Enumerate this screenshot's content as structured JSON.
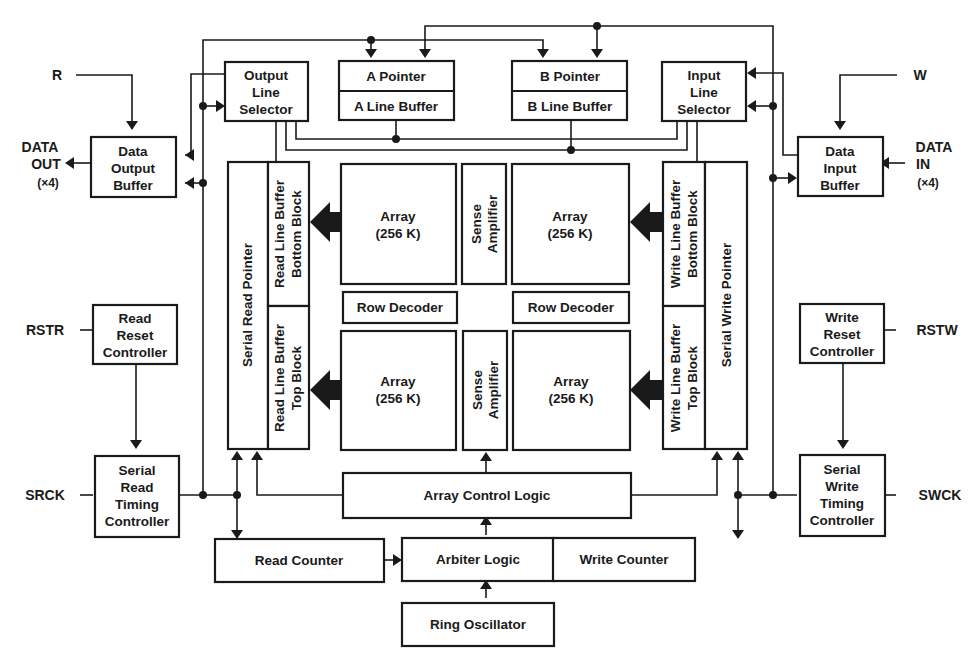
{
  "diagram": {
    "type": "block-diagram",
    "colors": {
      "ink": "#1a1a1a",
      "background": "#ffffff"
    }
  },
  "pins": {
    "r": "R",
    "w": "W",
    "data_out": [
      "DATA",
      "OUT",
      "(×4)"
    ],
    "data_in": [
      "DATA",
      "IN",
      "(×4)"
    ],
    "rstr": "RSTR",
    "rstw": "RSTW",
    "srck": "SRCK",
    "swck": "SWCK"
  },
  "blocks": {
    "output_line_selector": [
      "Output",
      "Line",
      "Selector"
    ],
    "input_line_selector": [
      "Input",
      "Line",
      "Selector"
    ],
    "a_pointer": "A Pointer",
    "a_line_buffer": "A Line Buffer",
    "b_pointer": "B Pointer",
    "b_line_buffer": "B Line Buffer",
    "data_output_buffer": [
      "Data",
      "Output",
      "Buffer"
    ],
    "data_input_buffer": [
      "Data",
      "Input",
      "Buffer"
    ],
    "serial_read_pointer": "Serial Read Pointer",
    "serial_write_pointer": "Serial Write Pointer",
    "read_line_buffer_bottom": [
      "Read Line Buffer",
      "Bottom Block"
    ],
    "read_line_buffer_top": [
      "Read Line Buffer",
      "Top Block"
    ],
    "write_line_buffer_bottom": [
      "Write Line Buffer",
      "Bottom Block"
    ],
    "write_line_buffer_top": [
      "Write Line Buffer",
      "Top Block"
    ],
    "array_tl": [
      "Array",
      "(256 K)"
    ],
    "array_tr": [
      "Array",
      "(256 K)"
    ],
    "array_bl": [
      "Array",
      "(256 K)"
    ],
    "array_br": [
      "Array",
      "(256 K)"
    ],
    "sense_amp_top": [
      "Sense",
      "Amplifier"
    ],
    "sense_amp_bottom": [
      "Sense",
      "Amplifier"
    ],
    "row_decoder_left": "Row Decoder",
    "row_decoder_right": "Row Decoder",
    "read_reset_controller": [
      "Read",
      "Reset",
      "Controller"
    ],
    "write_reset_controller": [
      "Write",
      "Reset",
      "Controller"
    ],
    "serial_read_timing_controller": [
      "Serial",
      "Read",
      "Timing",
      "Controller"
    ],
    "serial_write_timing_controller": [
      "Serial",
      "Write",
      "Timing",
      "Controller"
    ],
    "array_control_logic": "Array Control Logic",
    "read_counter": "Read Counter",
    "arbiter_logic": "Arbiter Logic",
    "write_counter": "Write Counter",
    "ring_oscillator": "Ring Oscillator"
  }
}
